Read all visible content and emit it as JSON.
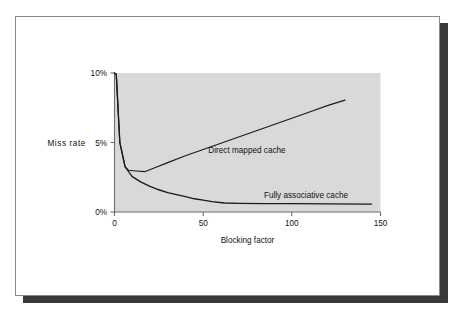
{
  "figure": {
    "frame_border_color": "#8a8a8a",
    "shadow_color": "#3a3a3a",
    "background": "#ffffff"
  },
  "chart_data": {
    "type": "line",
    "title": "",
    "subtitle": "",
    "xlabel": "Blocking factor",
    "ylabel": "Miss rate",
    "xlim": [
      0,
      150
    ],
    "ylim": [
      0,
      10
    ],
    "xticks": [
      0,
      50,
      100,
      150
    ],
    "xtick_labels": [
      "0",
      "50",
      "100",
      "150"
    ],
    "yticks": [
      0,
      5,
      10
    ],
    "ytick_labels": [
      "0%",
      "5%",
      "10%"
    ],
    "grid": false,
    "legend_position": "inline-annotations",
    "plot_background": "#d9d9d9",
    "line_color": "#1a1a1a",
    "series": [
      {
        "name": "Direct mapped cache",
        "label_text": "Direct mapped cache",
        "points": [
          [
            0,
            10.0
          ],
          [
            1,
            9.9
          ],
          [
            3,
            5.0
          ],
          [
            6,
            3.25
          ],
          [
            8,
            3.0
          ],
          [
            12,
            2.95
          ],
          [
            17,
            2.9
          ],
          [
            22,
            3.15
          ],
          [
            30,
            3.55
          ],
          [
            40,
            4.05
          ],
          [
            50,
            4.5
          ],
          [
            60,
            4.95
          ],
          [
            70,
            5.4
          ],
          [
            80,
            5.85
          ],
          [
            90,
            6.3
          ],
          [
            100,
            6.75
          ],
          [
            110,
            7.2
          ],
          [
            120,
            7.65
          ],
          [
            130,
            8.05
          ]
        ]
      },
      {
        "name": "Fully associative cache",
        "label_text": "Fully associative cache",
        "points": [
          [
            0,
            10.0
          ],
          [
            1,
            9.9
          ],
          [
            3,
            5.0
          ],
          [
            6,
            3.25
          ],
          [
            10,
            2.55
          ],
          [
            15,
            2.15
          ],
          [
            20,
            1.85
          ],
          [
            25,
            1.6
          ],
          [
            30,
            1.4
          ],
          [
            35,
            1.25
          ],
          [
            40,
            1.1
          ],
          [
            45,
            0.95
          ],
          [
            50,
            0.85
          ],
          [
            55,
            0.75
          ],
          [
            62,
            0.65
          ],
          [
            70,
            0.62
          ],
          [
            85,
            0.6
          ],
          [
            100,
            0.6
          ],
          [
            120,
            0.58
          ],
          [
            145,
            0.57
          ]
        ]
      }
    ],
    "annotations": [
      {
        "text": "Direct mapped cache",
        "x": 75,
        "y": 5.1
      },
      {
        "text": "Fully associative cache",
        "x": 72,
        "y": 1.1
      }
    ]
  }
}
